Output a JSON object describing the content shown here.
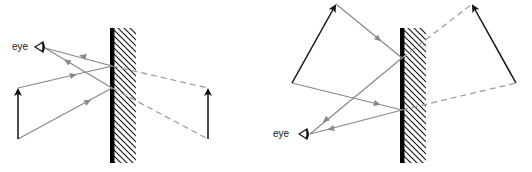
{
  "diagrams": [
    {
      "name": "plane-mirror-upright-object",
      "eye_label": "eye",
      "mirror": {
        "x": 112,
        "y1": 28,
        "y2": 162,
        "hatch_width": 22
      },
      "object": {
        "tail": [
          18,
          139
        ],
        "head": [
          18,
          88
        ]
      },
      "image": {
        "tail": [
          208,
          139
        ],
        "head": [
          208,
          88
        ]
      },
      "eye": [
        44,
        47
      ],
      "rays": [
        {
          "from": [
            18,
            88
          ],
          "hit": [
            112,
            66
          ],
          "to": [
            45,
            48
          ],
          "virtual_to": [
            208,
            88
          ]
        },
        {
          "from": [
            18,
            139
          ],
          "hit": [
            112,
            88
          ],
          "to": [
            45,
            48
          ],
          "virtual_to": [
            208,
            139
          ]
        }
      ]
    },
    {
      "name": "plane-mirror-tilted-object",
      "eye_label": "eye",
      "mirror": {
        "x": 402,
        "y1": 28,
        "y2": 162,
        "hatch_width": 22
      },
      "object": {
        "tail": [
          292,
          83
        ],
        "head": [
          336,
          4
        ]
      },
      "image": {
        "tail": [
          516,
          83
        ],
        "head": [
          472,
          4
        ]
      },
      "eye": [
        308,
        134
      ],
      "rays": [
        {
          "from": [
            336,
            4
          ],
          "hit": [
            402,
            58
          ],
          "to": [
            310,
            134
          ],
          "virtual_to": [
            472,
            4
          ]
        },
        {
          "from": [
            292,
            83
          ],
          "hit": [
            402,
            110
          ],
          "to": [
            310,
            134
          ],
          "virtual_to": [
            516,
            83
          ]
        }
      ]
    }
  ],
  "colors": {
    "mirror": "#000000",
    "ray": "#888888",
    "virtual_ray": "#999999",
    "object": "#111111"
  }
}
